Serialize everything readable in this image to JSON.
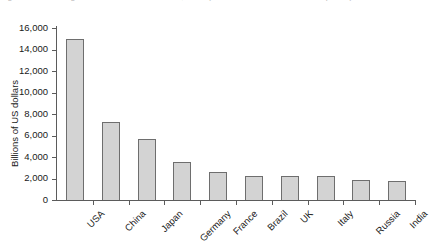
{
  "title_sliver": "Figure 1.1   The largest economies in the world, 2011 (GDP in US dollars at market prices)",
  "chart_data": {
    "type": "bar",
    "title": "",
    "xlabel": "",
    "ylabel": "Billions of US dollars",
    "categories": [
      "USA",
      "China",
      "Japan",
      "Germany",
      "France",
      "Brazil",
      "UK",
      "Italy",
      "Russia",
      "India"
    ],
    "values": [
      15000,
      7250,
      5700,
      3550,
      2600,
      2250,
      2250,
      2200,
      1900,
      1800
    ],
    "ylim": [
      0,
      16000
    ],
    "ytick_step": 2000,
    "ytick_labels": [
      "0",
      "2,000",
      "4,000",
      "6,000",
      "8,000",
      "10,000",
      "12,000",
      "14,000",
      "16,000"
    ],
    "ytick_values": [
      0,
      2000,
      4000,
      6000,
      8000,
      10000,
      12000,
      14000,
      16000
    ],
    "grid": false,
    "legend": false,
    "bar_fill_color": "#d3d3d3",
    "bar_edge_color": "#6e6e6e",
    "axis_color": "#5b5b5b",
    "text_color": "#1a1a1a"
  }
}
